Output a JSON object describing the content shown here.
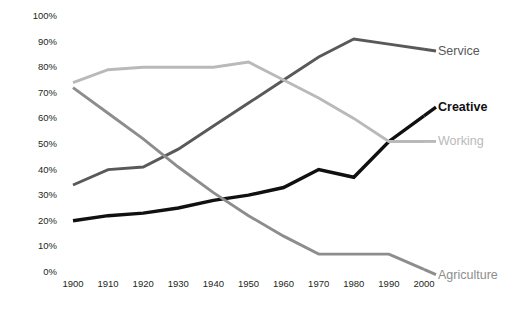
{
  "chart_data": {
    "type": "line",
    "title": "",
    "subtitle": "",
    "xlabel": "",
    "ylabel": "",
    "grid": false,
    "legend_position": "right-inline-end-of-line",
    "x": [
      1900,
      1910,
      1920,
      1930,
      1940,
      1950,
      1960,
      1970,
      1980,
      1990,
      2000
    ],
    "categories": [
      "1900",
      "1910",
      "1920",
      "1930",
      "1940",
      "1950",
      "1960",
      "1970",
      "1980",
      "1990",
      "2000"
    ],
    "xlim": [
      1900,
      2000
    ],
    "ylim": [
      0,
      100
    ],
    "ytick_labels": [
      "100%",
      "90%",
      "80%",
      "70%",
      "60%",
      "50%",
      "40%",
      "30%",
      "20%",
      "10%",
      "0%"
    ],
    "ytick_values": [
      100,
      90,
      80,
      70,
      60,
      50,
      40,
      30,
      20,
      10,
      0
    ],
    "yunit": "%",
    "series": [
      {
        "name": "Service",
        "color": "#595959",
        "values": [
          34,
          40,
          41,
          48,
          57,
          66,
          75,
          84,
          91,
          89,
          87
        ]
      },
      {
        "name": "Creative",
        "color": "#101010",
        "values": [
          20,
          22,
          23,
          25,
          28,
          30,
          33,
          40,
          37,
          51,
          61
        ]
      },
      {
        "name": "Working",
        "color": "#b9b9b9",
        "values": [
          74,
          79,
          80,
          80,
          80,
          82,
          75,
          68,
          60,
          51,
          51
        ]
      },
      {
        "name": "Agriculture",
        "color": "#8d8d8d",
        "values": [
          72,
          62,
          52,
          41,
          31,
          22,
          14,
          7,
          7,
          7,
          1
        ]
      }
    ]
  },
  "labels": {
    "service": "Service",
    "creative": "Creative",
    "working": "Working",
    "agriculture": "Agriculture"
  },
  "colors": {
    "service": "#595959",
    "creative": "#101010",
    "working": "#b9b9b9",
    "agriculture": "#8d8d8d",
    "axis_text": "#231f20",
    "background": "#ffffff"
  }
}
